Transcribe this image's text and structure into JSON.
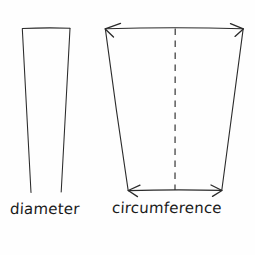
{
  "diagram": {
    "background_color": "#fefefe",
    "stroke_color": "#2b2b2b",
    "text_color": "#1a1a1a",
    "labels": {
      "left": "diameter",
      "right": "circumference"
    },
    "left_figure": {
      "name": "diameter-shape",
      "description": "narrow tapered open-bottom quadrilateral",
      "top_left": [
        22,
        28
      ],
      "top_right": [
        70,
        28
      ],
      "bottom_left": [
        31,
        192
      ],
      "bottom_right": [
        61,
        192
      ],
      "bottom_closed": false
    },
    "right_figure": {
      "name": "circumference-shape",
      "description": "wide tapered trapezoid with dashed center line and double-headed measurement arrows",
      "top_left": [
        105,
        28
      ],
      "top_right": [
        243,
        28
      ],
      "bottom_left": [
        128,
        190
      ],
      "bottom_right": [
        222,
        190
      ],
      "center_dashed_line_x": 175,
      "center_dashed_line_y_range": [
        28,
        190
      ],
      "top_arrow": {
        "name": "top-measurement-arrow",
        "from": [
          105,
          29
        ],
        "to": [
          243,
          29
        ],
        "double_headed": true
      },
      "bottom_arrow": {
        "name": "bottom-measurement-arrow",
        "from": [
          128,
          190
        ],
        "to": [
          222,
          190
        ],
        "double_headed": true
      }
    }
  }
}
